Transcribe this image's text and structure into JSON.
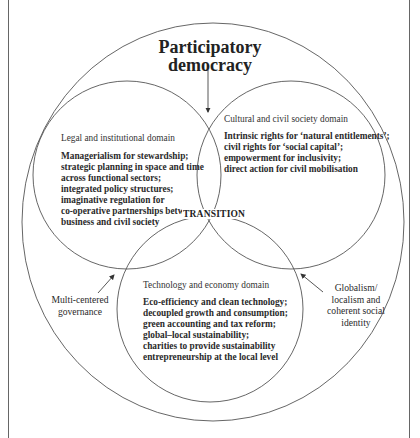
{
  "title": {
    "line1": "Participatory",
    "line2": "democracy"
  },
  "center_label": "TRANSITION",
  "domains": {
    "legal": {
      "label": "Legal and institutional domain",
      "lines": [
        "Managerialism for stewardship;",
        "strategic planning in space and time",
        "across functional sectors;",
        "integrated policy structures;",
        "imaginative regulation for",
        "co-operative partnerships between",
        "business and civil society"
      ]
    },
    "cultural": {
      "label": "Cultural and civil society domain",
      "lines": [
        "Intrinsic rights for ‘natural entitlements’;",
        "civil rights for ‘social capital’;",
        "empowerment for inclusivity;",
        "direct action for civil mobilisation"
      ]
    },
    "technology": {
      "label": "Technology and economy domain",
      "lines": [
        "Eco-efficiency and clean technology;",
        "decoupled growth and consumption;",
        "green accounting and tax reform;",
        "global–local sustainability;",
        "charities to provide sustainability",
        "entrepreneurship at the local level"
      ]
    }
  },
  "side_labels": {
    "left": [
      "Multi-centered",
      "governance"
    ],
    "right": [
      "Globalism/",
      "localism and",
      "coherent social",
      "identity"
    ]
  },
  "colors": {
    "line": "#555555",
    "text": "#222222"
  }
}
